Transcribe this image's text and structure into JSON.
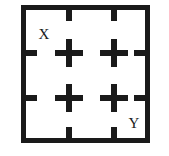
{
  "figure": {
    "type": "grid-diagram",
    "colors": {
      "stroke": "#1a1a1a",
      "background": "#ffffff"
    },
    "frame": {
      "x": 21,
      "y": 5,
      "width": 129,
      "height": 138,
      "stroke_width": 5
    },
    "labels": [
      {
        "text": "X",
        "x": 44,
        "y": 34
      },
      {
        "text": "Y",
        "x": 134,
        "y": 123
      }
    ],
    "ticks": {
      "top": [
        {
          "x": 69,
          "y": 5
        },
        {
          "x": 114,
          "y": 5
        }
      ],
      "bottom": [
        {
          "x": 69,
          "y": 143
        },
        {
          "x": 114,
          "y": 143
        }
      ],
      "left": [
        {
          "x": 21,
          "y": 53
        },
        {
          "x": 21,
          "y": 98
        }
      ],
      "right": [
        {
          "x": 150,
          "y": 53
        },
        {
          "x": 150,
          "y": 98
        }
      ]
    },
    "crosses": [
      {
        "x": 69,
        "y": 53
      },
      {
        "x": 114,
        "y": 53
      },
      {
        "x": 69,
        "y": 98
      },
      {
        "x": 114,
        "y": 98
      }
    ]
  }
}
